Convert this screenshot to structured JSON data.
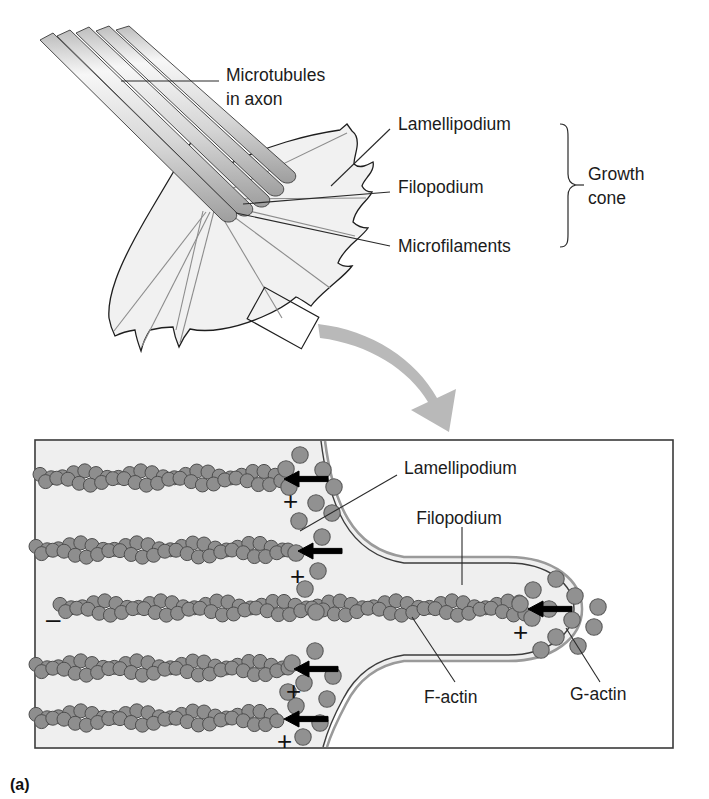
{
  "figure": {
    "caption": "(a)",
    "title_alt": "Growth cone structure and actin dynamics"
  },
  "panel_top": {
    "labels": {
      "microtubules_line1": "Microtubules",
      "microtubules_line2": "in axon",
      "lamellipodium": "Lamellipodium",
      "filopodium": "Filopodium",
      "microfilaments": "Microfilaments",
      "growth_cone_line1": "Growth",
      "growth_cone_line2": "cone"
    }
  },
  "panel_bottom": {
    "labels": {
      "lamellipodium": "Lamellipodium",
      "filopodium": "Filopodium",
      "f_actin": "F-actin",
      "g_actin": "G-actin"
    },
    "polarity": {
      "minus": "–",
      "plus": "+"
    },
    "filament_rows": [
      {
        "id": "row-1",
        "y": 478,
        "x_start": 40,
        "x_end": 272,
        "plus_x": 283,
        "plus_y": 510,
        "arrow_y": 479
      },
      {
        "id": "row-2",
        "y": 550,
        "x_start": 36,
        "x_end": 286,
        "plus_x": 290,
        "plus_y": 585,
        "arrow_y": 551
      },
      {
        "id": "row-3",
        "y": 608,
        "x_start": 60,
        "x_end": 516,
        "plus_x": 513,
        "plus_y": 641,
        "arrow_y": 609
      },
      {
        "id": "row-4",
        "y": 668,
        "x_start": 36,
        "x_end": 282,
        "plus_x": 286,
        "plus_y": 700,
        "arrow_y": 669
      },
      {
        "id": "row-5",
        "y": 718,
        "x_start": 36,
        "x_end": 272,
        "plus_x": 277,
        "plus_y": 750,
        "arrow_y": 719
      }
    ],
    "minus_marker": {
      "x": 46,
      "y": 628
    }
  },
  "colors": {
    "background": "#ffffff",
    "cytoplasm": "#efefef",
    "actin_fill": "#8e8e8e",
    "actin_stroke": "#4e4e4e",
    "membrane_dark": "#3c3c3c",
    "membrane_light": "#9a9a9a",
    "text": "#1b1b1b",
    "sweep_arrow": "#b9b9b9",
    "microtubule_light": "#f4f4f4",
    "microtubule_dark": "#a8a8a8"
  },
  "icons": {
    "growth_arrow": "arrow-left-icon",
    "sweep": "curved-arrow-icon",
    "zoom_region": "zoom-region-icon"
  }
}
